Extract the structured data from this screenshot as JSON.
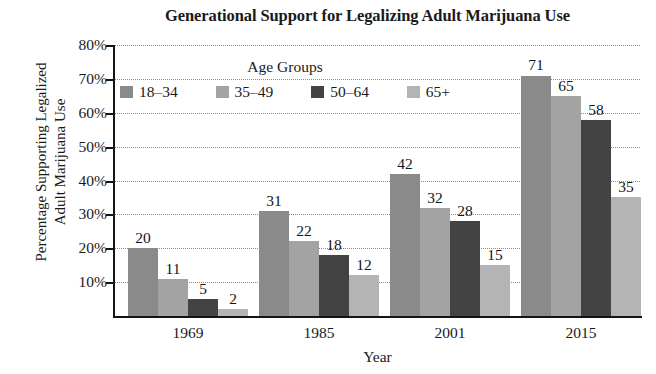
{
  "chart_data": {
    "type": "bar",
    "title": "Generational Support for Legalizing Adult Marijuana Use",
    "xlabel": "Year",
    "ylabel_line1": "Percentage Supporting Legalized",
    "ylabel_line2": "Adult Marijuana Use",
    "categories": [
      "1969",
      "1985",
      "2001",
      "2015"
    ],
    "series": [
      {
        "name": "18–34",
        "color": "#8a8a8a",
        "values": [
          20,
          31,
          42,
          71
        ]
      },
      {
        "name": "35–49",
        "color": "#a3a3a3",
        "values": [
          11,
          22,
          32,
          65
        ]
      },
      {
        "name": "50–64",
        "color": "#434343",
        "values": [
          5,
          18,
          28,
          58
        ]
      },
      {
        "name": "65+",
        "color": "#b4b4b4",
        "values": [
          2,
          12,
          15,
          35
        ]
      }
    ],
    "ylim": [
      0,
      80
    ],
    "ytick_labels": [
      "80%",
      "70%",
      "60%",
      "50%",
      "40%",
      "30%",
      "20%",
      "10%"
    ],
    "ytick_values": [
      80,
      70,
      60,
      50,
      40,
      30,
      20,
      10
    ],
    "grid": true,
    "legend_title": "Age Groups",
    "legend_position": "upper-center-inside"
  }
}
